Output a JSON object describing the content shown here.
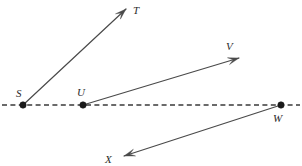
{
  "figure": {
    "background_color": "#ffffff",
    "width": 302,
    "height": 166
  },
  "colors": {
    "line": "#4a4a4a",
    "axis": "#3a3a3a",
    "dot": "#1a1a1a",
    "label": "#2b2b2b",
    "background": "#ffffff"
  },
  "axis": {
    "name": "dashed-horizontal-line",
    "x1": 2,
    "y1": 105,
    "x2": 300,
    "y2": 105,
    "dash_pattern": "5 3.4"
  },
  "points": [
    {
      "id": "S",
      "label": "S",
      "x": 23,
      "y": 105,
      "label_x": 16,
      "label_y": 97,
      "on_axis": true
    },
    {
      "id": "U",
      "label": "U",
      "x": 83,
      "y": 105,
      "label_x": 77,
      "label_y": 96,
      "on_axis": true
    },
    {
      "id": "W",
      "label": "W",
      "x": 281,
      "y": 105,
      "label_x": 273,
      "label_y": 122,
      "on_axis": true
    }
  ],
  "endpoints": [
    {
      "id": "T",
      "label": "T",
      "x": 126,
      "y": 9,
      "label_x": 133,
      "label_y": 14
    },
    {
      "id": "V",
      "label": "V",
      "x": 239,
      "y": 58,
      "label_x": 226,
      "label_y": 50
    },
    {
      "id": "X",
      "label": "X",
      "x": 124,
      "y": 156,
      "label_x": 105,
      "label_y": 163
    }
  ],
  "rays": [
    {
      "id": "ray-ST",
      "from": "S",
      "to": "T",
      "x1": 23,
      "y1": 105,
      "x2": 126,
      "y2": 9,
      "arrow_at": "end"
    },
    {
      "id": "ray-UV",
      "from": "U",
      "to": "V",
      "x1": 83,
      "y1": 105,
      "x2": 239,
      "y2": 58,
      "arrow_at": "end"
    },
    {
      "id": "ray-WX",
      "from": "W",
      "to": "X",
      "x1": 281,
      "y1": 105,
      "x2": 124,
      "y2": 156,
      "arrow_at": "end"
    }
  ]
}
